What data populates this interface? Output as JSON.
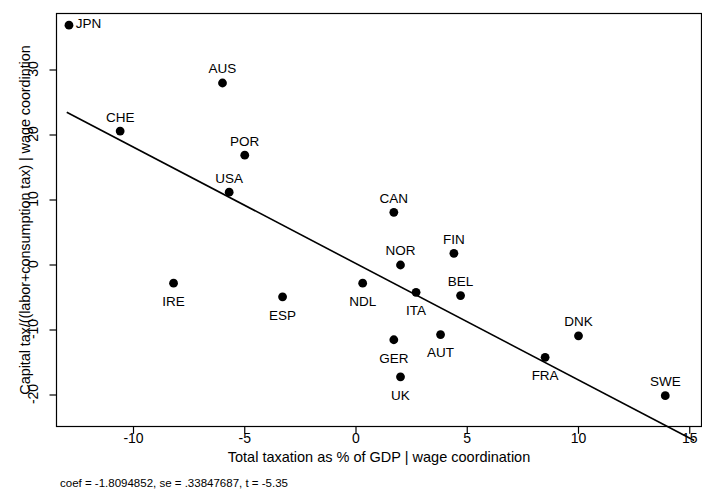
{
  "chart_data": {
    "type": "scatter",
    "title": "",
    "xlabel": "Total taxation as % of GDP | wage coordination",
    "ylabel": "Capital tax/((labor+consumption tax) | wage coordintion",
    "xlim": [
      -13.6,
      15.6
    ],
    "ylim": [
      -22.5,
      38.5
    ],
    "xticks": [
      -10,
      -5,
      0,
      5,
      10,
      15
    ],
    "xticklabels": [
      "-10",
      "-5",
      "0",
      "5",
      "10",
      "15"
    ],
    "yticks": [
      30,
      20,
      10,
      0,
      -10,
      -20
    ],
    "yticklabels": [
      "30",
      "20",
      "10",
      "0",
      "-10",
      "-20"
    ],
    "grid": false,
    "legend": "none",
    "marker": "filled-circle",
    "marker_color": "#000000",
    "line_color": "#000000",
    "points": [
      {
        "label": "JPN",
        "x": -12.9,
        "y": 36.9,
        "lx": 5.5,
        "ly": 0.6
      },
      {
        "label": "AUS",
        "x": -6.0,
        "y": 28.0,
        "lx": 0.0,
        "ly": 2.6
      },
      {
        "label": "CHE",
        "x": -10.6,
        "y": 20.6,
        "lx": 0.1,
        "ly": 2.6
      },
      {
        "label": "POR",
        "x": -5.0,
        "y": 16.9,
        "lx": 0.0,
        "ly": 2.6
      },
      {
        "label": "USA",
        "x": -5.7,
        "y": 11.2,
        "lx": 0.0,
        "ly": 2.6
      },
      {
        "label": "CAN",
        "x": 1.7,
        "y": 8.1,
        "lx": 0.0,
        "ly": 2.6
      },
      {
        "label": "NOR",
        "x": 2.0,
        "y": 0.0,
        "lx": 0.0,
        "ly": 2.6
      },
      {
        "label": "FIN",
        "x": 4.4,
        "y": 1.8,
        "lx": 0.0,
        "ly": 2.6
      },
      {
        "label": "IRE",
        "x": -8.2,
        "y": -2.8,
        "lx": 0.0,
        "ly": -3.0
      },
      {
        "label": "NDL",
        "x": 0.3,
        "y": -2.8,
        "lx": 0.0,
        "ly": -3.0
      },
      {
        "label": "ITA",
        "x": 2.7,
        "y": -4.2,
        "lx": 0.0,
        "ly": -3.0
      },
      {
        "label": "BEL",
        "x": 4.7,
        "y": -4.7,
        "lx": 0.0,
        "ly": 2.6
      },
      {
        "label": "ESP",
        "x": -3.3,
        "y": -4.9,
        "lx": 0.0,
        "ly": -3.0
      },
      {
        "label": "GER",
        "x": 1.7,
        "y": -11.5,
        "lx": 0.0,
        "ly": -3.0
      },
      {
        "label": "AUT",
        "x": 3.8,
        "y": -10.7,
        "lx": 0.0,
        "ly": -3.0
      },
      {
        "label": "DNK",
        "x": 10.0,
        "y": -10.9,
        "lx": 0.0,
        "ly": 2.6
      },
      {
        "label": "UK",
        "x": 2.0,
        "y": -17.2,
        "lx": 0.0,
        "ly": -3.0
      },
      {
        "label": "FRA",
        "x": 8.5,
        "y": -14.2,
        "lx": 0.0,
        "ly": -3.0
      },
      {
        "label": "SWE",
        "x": 13.9,
        "y": -20.1,
        "lx": 0.0,
        "ly": 2.6
      }
    ],
    "fit_line": {
      "slope": -1.8094852,
      "intercept": 0.0,
      "x_start": -13.0,
      "x_end": 15.2,
      "y_start": 23.5,
      "y_end": -27.0
    },
    "annotation": "coef = -1.8094852, se = .33847687, t = -5.35",
    "stats": {
      "coef": "-1.8094852",
      "se": ".33847687",
      "t": "-5.35"
    }
  }
}
